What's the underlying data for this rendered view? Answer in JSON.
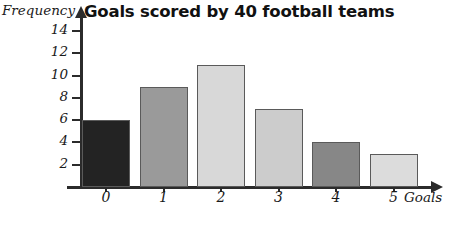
{
  "chart_data": {
    "type": "bar",
    "title": "Goals scored by 40 football teams",
    "xlabel": "Goals",
    "ylabel": "Frequency",
    "categories": [
      "0",
      "1",
      "2",
      "3",
      "4",
      "5"
    ],
    "values": [
      6,
      9,
      11,
      7,
      4,
      3
    ],
    "ylim": [
      0,
      15
    ],
    "yticks": [
      2,
      4,
      6,
      8,
      10,
      12,
      14
    ],
    "ytick_labels": [
      "2",
      "4",
      "6",
      "8",
      "10",
      "12",
      "14"
    ],
    "grid": false,
    "legend": "none",
    "bar_colors": [
      "#232323",
      "#9a9a9a",
      "#d8d8d8",
      "#cccccc",
      "#878787",
      "#dcdcdc"
    ],
    "bar_border_color": "#5a5a5a",
    "axis_color": "#2b2b2b",
    "total": 40
  }
}
